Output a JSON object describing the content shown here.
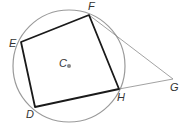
{
  "figure": {
    "circle": {
      "center_label": "C",
      "cx": 69,
      "cy": 66,
      "r": 56,
      "color": "#9a9a9a"
    },
    "points": {
      "E": {
        "x": 21,
        "y": 42,
        "label": "E",
        "lx": 9,
        "ly": 47
      },
      "F": {
        "x": 89,
        "y": 15,
        "label": "F",
        "lx": 88,
        "ly": 10
      },
      "H": {
        "x": 119,
        "y": 89,
        "label": "H",
        "lx": 117,
        "ly": 101
      },
      "D": {
        "x": 35,
        "y": 107,
        "label": "D",
        "lx": 26,
        "ly": 118
      },
      "G": {
        "x": 173,
        "y": 79,
        "label": "G",
        "lx": 170,
        "ly": 91
      },
      "C": {
        "x": 69,
        "y": 66,
        "label": "C",
        "lx": 59,
        "ly": 66
      }
    },
    "quadrilateral": [
      "D",
      "E",
      "F",
      "H"
    ],
    "tangent_segments": [
      [
        "F",
        "G"
      ],
      [
        "H",
        "G"
      ]
    ]
  }
}
